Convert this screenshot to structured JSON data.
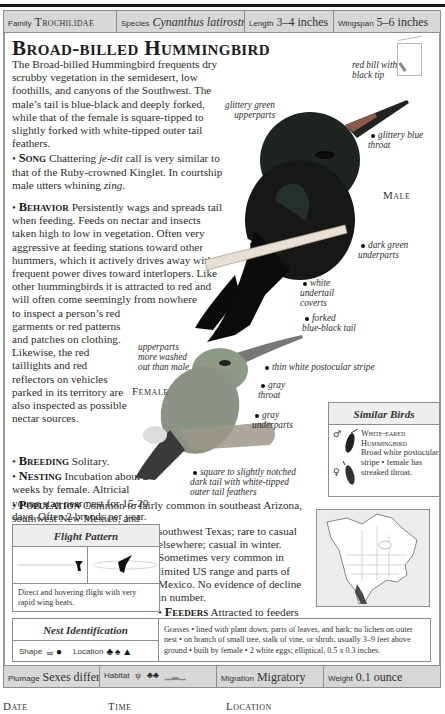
{
  "header": {
    "family_label": "Family",
    "family_value": "Trochilidae",
    "species_label": "Species",
    "species_value": "Cynanthus latirostris",
    "length_label": "Length",
    "length_value": "3–4 inches",
    "wingspan_label": "Wingspan",
    "wingspan_value": "5–6 inches"
  },
  "title": "Broad-billed Hummingbird",
  "intro": "The Broad-billed Hummingbird frequents dry scrubby vegetation in the semidesert, low foothills, and canyons of the Southwest. The male’s tail is blue-black and deeply forked, while that of the female is square-tipped to slightly forked with white-tipped outer tail feathers.",
  "sections": {
    "song": {
      "heading": "Song",
      "text_before": " Chattering ",
      "italic_1": "je-dit",
      "text_middle": " call is very similar to that of the Ruby-crowned Kinglet. In courtship male utters whining ",
      "italic_2": "zing",
      "text_after": "."
    },
    "behavior": {
      "heading": "Behavior",
      "text": " Persistently wags and spreads tail when feeding. Feeds on nectar and insects taken high to low in vegetation. Often very aggressive at feeding stations toward other hummers, which it actively drives away with frequent power dives toward interlopers. Like other hummingbirds it is attracted to red and will often come seemingly from nowhere to inspect a person’s red garments or red patterns and patches on clothing. Likewise, the red taillights and red reflectors on vehicles parked in its territory are also inspected as possible nectar sources."
    },
    "breeding": {
      "heading": "Breeding",
      "text": " Solitary."
    },
    "nesting": {
      "heading": "Nesting",
      "text": " Incubation about 2 weeks by female. Altricial young stay near nest for 15-20 days. Often 2 broods per year."
    },
    "population": {
      "heading": "Population",
      "text_1": " Common to fairly common in southeast Arizona, southwest New Mexico, and",
      "text_2": "southwest Texas; rare to casual elsewhere; casual in winter. Sometimes very common in limited US range and parts of Mexico. No evidence of decline in number."
    },
    "feeders": {
      "heading": "Feeders",
      "text": " Attracted to feeders with sugar water."
    }
  },
  "illustration": {
    "male_label": "Male",
    "female_label": "Female",
    "male_callouts": [
      "red bill with black tip",
      "glittery green upperparts",
      "glittery blue throat",
      "dark green underparts",
      "white undertail coverts",
      "forked blue-black tail"
    ],
    "female_callouts": [
      "upperparts more washed out than male",
      "thin white postocular stripe",
      "gray throat",
      "gray underparts",
      "square to slightly notched dark tail with white-tipped outer tail feathers"
    ]
  },
  "similar_birds": {
    "header": "Similar Birds",
    "male_symbol": "♂",
    "female_symbol": "♀",
    "name": "White-eared Hummingbird",
    "description": "Broad white postocular stripe • female has streaked throat."
  },
  "flight_pattern": {
    "header": "Flight Pattern",
    "caption": "Direct and hovering flight with very rapid wing beats."
  },
  "nest_identification": {
    "header": "Nest Identification",
    "shape_label": "Shape",
    "location_label": "Location",
    "shape_icons": [
      "cup-nest-icon",
      "pendant-nest-icon"
    ],
    "location_icons": [
      "shrub-icon",
      "tree-icon",
      "ground-icon"
    ],
    "text": "Grasses • lined with plant down, parts of leaves, and bark; no lichen on outer nest • on branch of small tree, stalk of vine, or shrub, usually 3–9 feet above ground • built by female • 2 white eggs; elliptical, 0.5 x 0.3 inches."
  },
  "footer_bar": {
    "plumage_label": "Plumage",
    "plumage_value": "Sexes differ",
    "habitat_label": "Habitat",
    "migration_label": "Migration",
    "migration_value": "Migratory",
    "weight_label": "Weight",
    "weight_value": "0.1 ounce"
  },
  "log_fields": {
    "date": "Date",
    "time": "Time",
    "location": "Location"
  },
  "colors": {
    "bar_gray": "#d7d7d7",
    "border_gray": "#8c8c8c",
    "range_map_dark": "#4a4a4a"
  }
}
